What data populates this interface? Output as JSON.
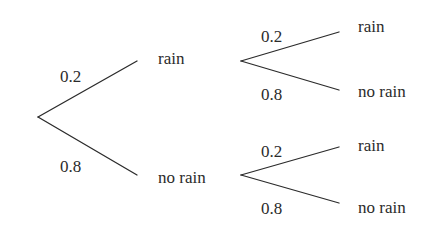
{
  "diagram": {
    "type": "probability-tree",
    "stroke_color": "#2b2b2b",
    "background": "#ffffff",
    "level1": {
      "upper": {
        "probability": "0.2",
        "outcome": "rain"
      },
      "lower": {
        "probability": "0.8",
        "outcome": "no rain"
      }
    },
    "level2": {
      "after_rain": {
        "upper": {
          "probability": "0.2",
          "outcome": "rain"
        },
        "lower": {
          "probability": "0.8",
          "outcome": "no rain"
        }
      },
      "after_no_rain": {
        "upper": {
          "probability": "0.2",
          "outcome": "rain"
        },
        "lower": {
          "probability": "0.8",
          "outcome": "no rain"
        }
      }
    }
  }
}
